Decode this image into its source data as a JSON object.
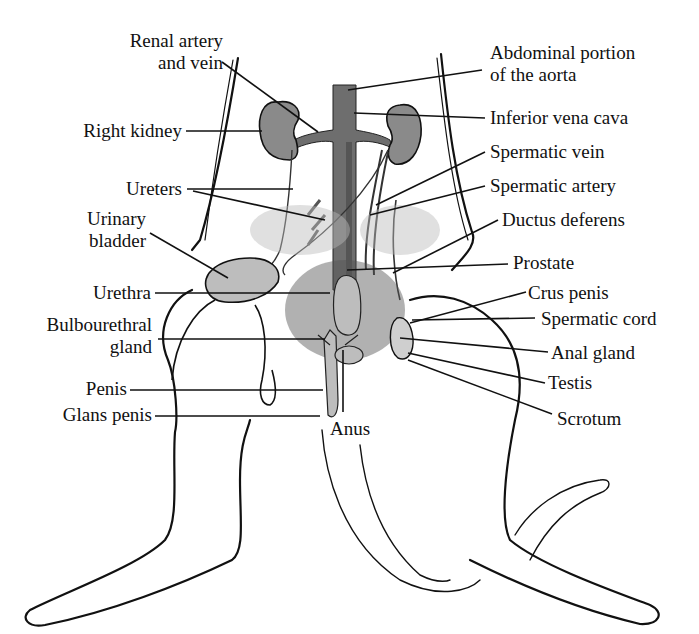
{
  "diagram": {
    "colors": {
      "outline": "#111111",
      "organ_fill": "#8a8a8a",
      "vessel_fill": "#6e6e6e",
      "light_organ_fill": "#bdbdbd",
      "background": "#ffffff",
      "label_text": "#111111"
    },
    "labels_left": [
      {
        "id": "renal",
        "line1": "Renal artery",
        "line2": "and vein"
      },
      {
        "id": "right_kidney",
        "line1": "Right kidney"
      },
      {
        "id": "ureters",
        "line1": "Ureters"
      },
      {
        "id": "urinary_bladder",
        "line1": "Urinary",
        "line2": "bladder"
      },
      {
        "id": "urethra",
        "line1": "Urethra"
      },
      {
        "id": "bulbourethral",
        "line1": "Bulbourethral",
        "line2": "gland"
      },
      {
        "id": "penis",
        "line1": "Penis"
      },
      {
        "id": "glans_penis",
        "line1": "Glans penis"
      }
    ],
    "labels_right": [
      {
        "id": "aorta",
        "line1": "Abdominal portion",
        "line2": "of the aorta"
      },
      {
        "id": "ivc",
        "line1": "Inferior vena cava"
      },
      {
        "id": "spermatic_vein",
        "line1": "Spermatic vein"
      },
      {
        "id": "spermatic_artery",
        "line1": "Spermatic artery"
      },
      {
        "id": "ductus",
        "line1": "Ductus deferens"
      },
      {
        "id": "prostate",
        "line1": "Prostate"
      },
      {
        "id": "crus",
        "line1": "Crus penis"
      },
      {
        "id": "spermatic_cord",
        "line1": "Spermatic cord"
      },
      {
        "id": "anal_gland",
        "line1": "Anal gland"
      },
      {
        "id": "testis",
        "line1": "Testis"
      },
      {
        "id": "scrotum",
        "line1": "Scrotum"
      }
    ],
    "labels_center": [
      {
        "id": "anus",
        "line1": "Anus"
      }
    ]
  }
}
